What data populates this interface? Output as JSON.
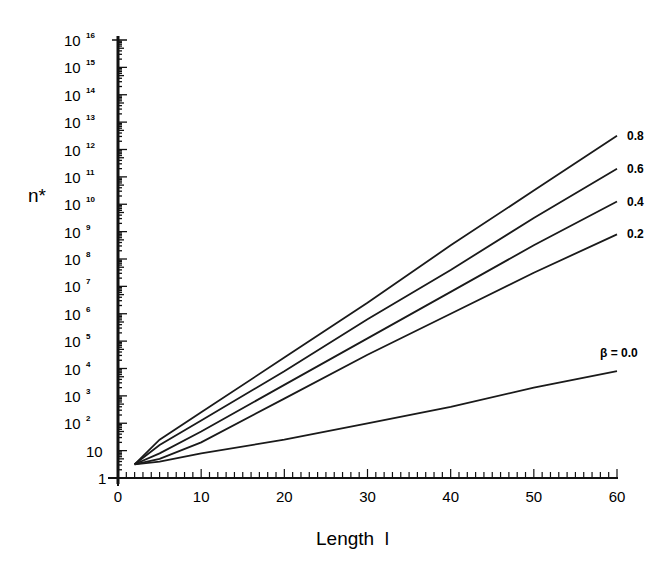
{
  "chart_data": {
    "type": "line",
    "title": "",
    "xlabel": "Length  l",
    "ylabel": "n*",
    "xlim": [
      0,
      60
    ],
    "ylim_log10": [
      0,
      16
    ],
    "y_scale": "log",
    "x_ticks": [
      0,
      10,
      20,
      30,
      40,
      50,
      60
    ],
    "y_ticks": [
      {
        "base": "1",
        "exp": ""
      },
      {
        "base": "10",
        "exp": ""
      },
      {
        "base": "10",
        "exp": "2"
      },
      {
        "base": "10",
        "exp": "3"
      },
      {
        "base": "10",
        "exp": "4"
      },
      {
        "base": "10",
        "exp": "5"
      },
      {
        "base": "10",
        "exp": "6"
      },
      {
        "base": "10",
        "exp": "7"
      },
      {
        "base": "10",
        "exp": "8"
      },
      {
        "base": "10",
        "exp": "9"
      },
      {
        "base": "10",
        "exp": "10"
      },
      {
        "base": "10",
        "exp": "11"
      },
      {
        "base": "10",
        "exp": "12"
      },
      {
        "base": "10",
        "exp": "13"
      },
      {
        "base": "10",
        "exp": "14"
      },
      {
        "base": "10",
        "exp": "15"
      },
      {
        "base": "10",
        "exp": "16"
      }
    ],
    "grid": false,
    "legend": "inline labels at right end of curves",
    "x": [
      2,
      5,
      10,
      20,
      30,
      40,
      50,
      60
    ],
    "series": [
      {
        "name": "0.8",
        "label": "0.8",
        "log10_values": [
          0.5,
          1.4,
          2.4,
          4.4,
          6.4,
          8.5,
          10.5,
          12.5
        ]
      },
      {
        "name": "0.6",
        "label": "0.6",
        "log10_values": [
          0.5,
          1.2,
          2.1,
          3.9,
          5.8,
          7.6,
          9.5,
          11.3
        ]
      },
      {
        "name": "0.4",
        "label": "0.4",
        "log10_values": [
          0.5,
          0.9,
          1.7,
          3.4,
          5.1,
          6.8,
          8.5,
          10.1
        ]
      },
      {
        "name": "0.2",
        "label": "0.2",
        "log10_values": [
          0.5,
          0.7,
          1.3,
          2.9,
          4.5,
          6.0,
          7.5,
          8.9
        ]
      },
      {
        "name": "0.0",
        "label": "β = 0.0",
        "log10_values": [
          0.5,
          0.6,
          0.9,
          1.4,
          2.0,
          2.6,
          3.3,
          3.9
        ]
      }
    ]
  },
  "labels": {
    "ylabel": "n*",
    "xlabel": "Length  l"
  }
}
